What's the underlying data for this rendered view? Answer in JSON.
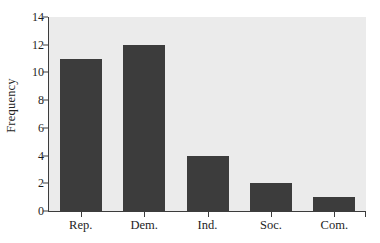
{
  "chart_data": {
    "type": "bar",
    "title": "",
    "xlabel": "",
    "ylabel": "Frequency",
    "categories": [
      "Rep.",
      "Dem.",
      "Ind.",
      "Soc.",
      "Com."
    ],
    "values": [
      11,
      12,
      4,
      2,
      1
    ],
    "ylim": [
      0,
      14
    ],
    "yticks": [
      0,
      2,
      4,
      6,
      8,
      10,
      12,
      14
    ],
    "ytick_labels": [
      "0",
      "2",
      "4",
      "6",
      "8",
      "10",
      "12",
      "14"
    ],
    "grid": false,
    "legend": null,
    "bar_color": "#3c3c3c",
    "plot_background": "#ebebeb",
    "figure_background": "#ffffff",
    "axis_color": "#3c3c3c"
  }
}
